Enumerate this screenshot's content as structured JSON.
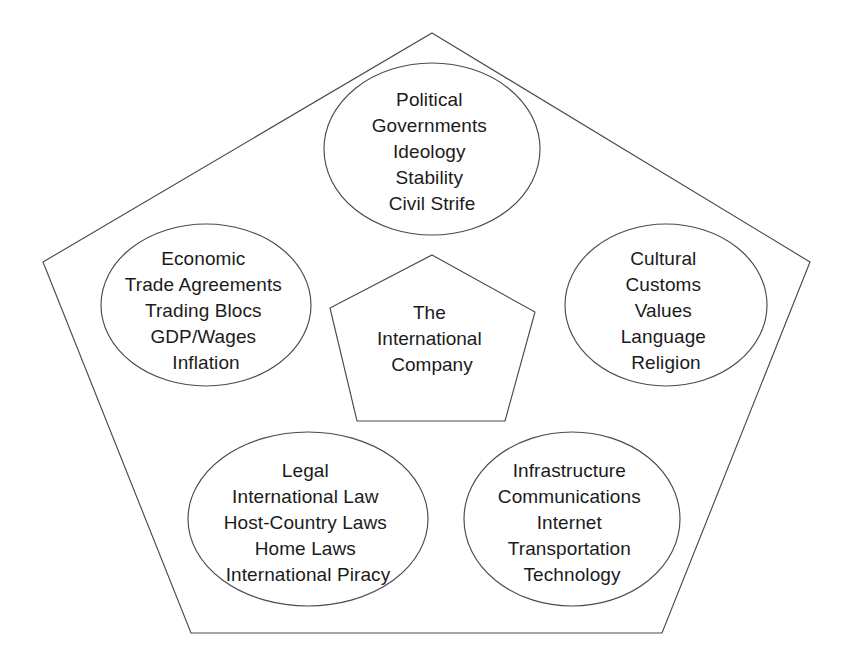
{
  "diagram": {
    "type": "pentagon-with-ellipses",
    "stroke_color": "#4a4a4f",
    "text_color": "#1b1b1b",
    "background_color": "#ffffff",
    "center": {
      "name": "center-node",
      "shape": "pentagon",
      "lines": [
        "The",
        "International",
        "Company"
      ]
    },
    "nodes": [
      {
        "key": "political",
        "name": "political-node",
        "shape": "ellipse",
        "position": "top",
        "heading": "Political",
        "lines": [
          "Political",
          "Governments",
          "Ideology",
          "Stability",
          "Civil Strife"
        ]
      },
      {
        "key": "economic",
        "name": "economic-node",
        "shape": "ellipse",
        "position": "left",
        "heading": "Economic",
        "lines": [
          "Economic",
          "Trade Agreements",
          "Trading Blocs",
          "GDP/Wages",
          "Inflation"
        ]
      },
      {
        "key": "cultural",
        "name": "cultural-node",
        "shape": "ellipse",
        "position": "right",
        "heading": "Cultural",
        "lines": [
          "Cultural",
          "Customs",
          "Values",
          "Language",
          "Religion"
        ]
      },
      {
        "key": "legal",
        "name": "legal-node",
        "shape": "ellipse",
        "position": "bottom-left",
        "heading": "Legal",
        "lines": [
          "Legal",
          "International Law",
          "Host-Country Laws",
          "Home Laws",
          "International Piracy"
        ]
      },
      {
        "key": "infrastructure",
        "name": "infrastructure-node",
        "shape": "ellipse",
        "position": "bottom-right",
        "heading": "Infrastructure",
        "lines": [
          "Infrastructure",
          "Communications",
          "Internet",
          "Transportation",
          "Technology"
        ]
      }
    ],
    "outer_pentagon_points": "432,33 810,262 662,633 191,633 43,262",
    "inner_pentagon_points": "432,255 535,312 505,421 357,421 330,308"
  }
}
